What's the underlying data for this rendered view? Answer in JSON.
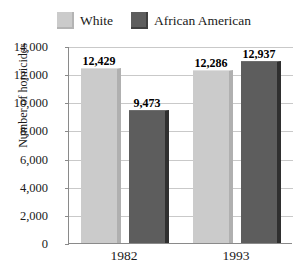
{
  "chart_data": {
    "type": "bar",
    "title": "",
    "xlabel": "",
    "ylabel": "Number of homicides",
    "categories": [
      "1982",
      "1993"
    ],
    "series": [
      {
        "name": "White",
        "color": "#cbcbcb",
        "values": [
          12429,
          12286
        ],
        "labels": [
          "12,429",
          "12,286"
        ]
      },
      {
        "name": "African American",
        "color": "#5d5d5d",
        "values": [
          9473,
          12937
        ],
        "labels": [
          "9,473",
          "12,937"
        ]
      }
    ],
    "ylim": [
      0,
      14000
    ],
    "ytick_values": [
      0,
      2000,
      4000,
      6000,
      8000,
      10000,
      12000,
      14000
    ],
    "ytick_labels": [
      "0",
      "2,000",
      "4,000",
      "6,000",
      "8,000",
      "10,000",
      "12,000",
      "14,000"
    ],
    "grid": true,
    "legend_position": "top-center"
  },
  "legend": {
    "entries": [
      {
        "label": "White",
        "swatch": "legend-swatch-white"
      },
      {
        "label": "African American",
        "swatch": "legend-swatch-african-american"
      }
    ]
  },
  "axes": {
    "y_title": "Number of homicides"
  }
}
